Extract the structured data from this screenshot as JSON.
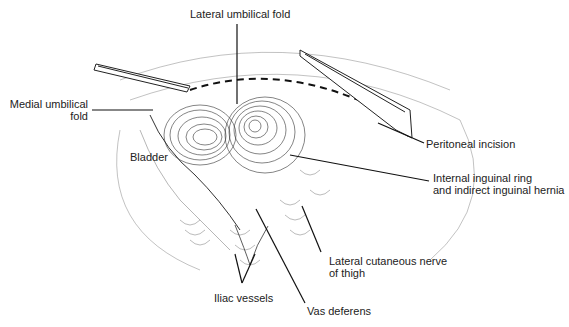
{
  "figure": {
    "type": "anatomical illustration",
    "labels": {
      "lateral_umbilical_fold": "Lateral umbilical fold",
      "medial_umbilical_fold_1": "Medial umbilical",
      "medial_umbilical_fold_2": "fold",
      "bladder": "Bladder",
      "peritoneal_incision": "Peritoneal incision",
      "internal_ring_1": "Internal inguinal ring",
      "internal_ring_2": "and indirect inguinal hernia",
      "lateral_cutaneous_1": "Lateral cutaneous nerve",
      "lateral_cutaneous_2": "of thigh",
      "iliac_vessels": "Iliac vessels",
      "vas_deferens": "Vas deferens"
    },
    "colors": {
      "ink": "#222222",
      "background": "#ffffff"
    }
  }
}
